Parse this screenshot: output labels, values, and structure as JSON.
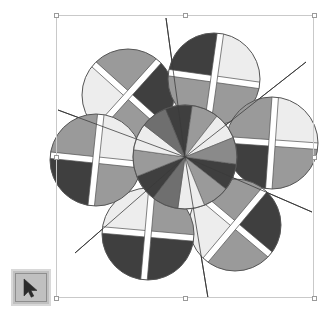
{
  "app": {
    "background_color": "#ffffff",
    "canvas": {
      "width": 333,
      "height": 321
    }
  },
  "selection": {
    "label": "Selected object bounding box",
    "x": 56,
    "y": 15,
    "width": 258,
    "height": 283,
    "border_color": "#c9c9c9",
    "handle_fill": "#ffffff",
    "handle_border": "#9a9a9a",
    "handles": [
      {
        "name": "handle-top-left",
        "x": 56,
        "y": 15
      },
      {
        "name": "handle-top-center",
        "x": 185,
        "y": 15
      },
      {
        "name": "handle-top-right",
        "x": 314,
        "y": 15
      },
      {
        "name": "handle-middle-left",
        "x": 56,
        "y": 157
      },
      {
        "name": "handle-middle-right",
        "x": 314,
        "y": 157
      },
      {
        "name": "handle-bottom-left",
        "x": 56,
        "y": 298
      },
      {
        "name": "handle-bottom-center",
        "x": 185,
        "y": 298
      },
      {
        "name": "handle-bottom-right",
        "x": 314,
        "y": 298
      }
    ]
  },
  "toolbar": {
    "pointer_tool": {
      "label": "Pointer",
      "icon": "arrow-pointer-icon",
      "x": 11,
      "y": 269,
      "width": 40,
      "height": 37,
      "face_color": "#c0c0c0",
      "bevel_color": "#d8d8d8",
      "icon_color": "#2b2b2b"
    }
  },
  "artwork": {
    "title": "Pinwheel flower geometric figure",
    "outline_color": "#555555",
    "line_color": "#3a3a3a",
    "palette": {
      "dark": "#3f3f3f",
      "medium": "#9a9a9a",
      "light": "#ededed",
      "white": "#ffffff",
      "stroke": "#5a5a5a"
    },
    "center": {
      "cx": 185,
      "cy": 157,
      "r": 52
    },
    "center_wedges": {
      "count": 12,
      "start_angle_deg": 8,
      "colors": [
        "#3f3f3f",
        "#9a9a9a",
        "#ededed",
        "#6f6f6f",
        "#3f3f3f",
        "#9a9a9a",
        "#ededed",
        "#6f6f6f",
        "#3f3f3f",
        "#9a9a9a",
        "#ededed",
        "#8a8a8a"
      ]
    },
    "petals": [
      {
        "name": "petal-top-left",
        "cx": 128,
        "cy": 95,
        "r": 46,
        "cross_angle_deg": 42,
        "quadrants": [
          "#3f3f3f",
          "#9a9a9a",
          "#ededed",
          "#9a9a9a"
        ]
      },
      {
        "name": "petal-top-right",
        "cx": 214,
        "cy": 79,
        "r": 46,
        "cross_angle_deg": 8,
        "quadrants": [
          "#ededed",
          "#9a9a9a",
          "#9a9a9a",
          "#3f3f3f"
        ]
      },
      {
        "name": "petal-right",
        "cx": 272,
        "cy": 143,
        "r": 46,
        "cross_angle_deg": 4,
        "quadrants": [
          "#ededed",
          "#9a9a9a",
          "#3f3f3f",
          "#9a9a9a"
        ]
      },
      {
        "name": "petal-bottom-right",
        "cx": 235,
        "cy": 225,
        "r": 46,
        "cross_angle_deg": 40,
        "quadrants": [
          "#3f3f3f",
          "#9a9a9a",
          "#ededed",
          "#9a9a9a"
        ]
      },
      {
        "name": "petal-bottom-left",
        "cx": 148,
        "cy": 234,
        "r": 46,
        "cross_angle_deg": 5,
        "quadrants": [
          "#9a9a9a",
          "#3f3f3f",
          "#3f3f3f",
          "#ededed"
        ]
      },
      {
        "name": "petal-left",
        "cx": 96,
        "cy": 160,
        "r": 46,
        "cross_angle_deg": 6,
        "quadrants": [
          "#ededed",
          "#9a9a9a",
          "#3f3f3f",
          "#9a9a9a"
        ]
      }
    ],
    "rays": [
      {
        "name": "ray-top",
        "x1": 185,
        "y1": 157,
        "x2": 166,
        "y2": 18
      },
      {
        "name": "ray-upper-right",
        "x1": 185,
        "y1": 157,
        "x2": 306,
        "y2": 62
      },
      {
        "name": "ray-right",
        "x1": 185,
        "y1": 157,
        "x2": 312,
        "y2": 212
      },
      {
        "name": "ray-bottom",
        "x1": 185,
        "y1": 157,
        "x2": 208,
        "y2": 298
      },
      {
        "name": "ray-lower-left",
        "x1": 185,
        "y1": 157,
        "x2": 75,
        "y2": 253
      },
      {
        "name": "ray-left",
        "x1": 185,
        "y1": 157,
        "x2": 58,
        "y2": 110
      }
    ]
  }
}
